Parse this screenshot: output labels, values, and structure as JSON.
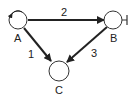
{
  "diagram": {
    "type": "directed-graph",
    "nodes": [
      {
        "id": "A",
        "label": "A",
        "self_loop": true
      },
      {
        "id": "B",
        "label": "B",
        "inhibitor_bar": true
      },
      {
        "id": "C",
        "label": "C"
      }
    ],
    "edges": [
      {
        "from": "A",
        "to": "B",
        "label": "2"
      },
      {
        "from": "A",
        "to": "C",
        "label": "1"
      },
      {
        "from": "B",
        "to": "C",
        "label": "3"
      }
    ],
    "colors": {
      "stroke": "#222222",
      "background": "#ffffff"
    }
  }
}
